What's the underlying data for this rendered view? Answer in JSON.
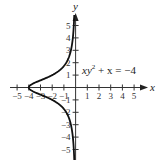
{
  "figure": {
    "x_axis_label": "x",
    "y_axis_label": "y",
    "equation": {
      "base": "xy",
      "superscript": "2",
      "rest": " + x = −4"
    },
    "x_ticks": [
      "−5",
      "−4",
      "−3",
      "−2",
      "−1",
      "1",
      "2",
      "3",
      "4",
      "5"
    ],
    "y_ticks": [
      "5",
      "4",
      "3",
      "2",
      "1",
      "−1",
      "−2",
      "−3",
      "−4",
      "−5"
    ]
  },
  "chart_data": {
    "type": "line",
    "title": "",
    "equation": "xy^2 + x = -4",
    "function": "x = -4 / (1 + y^2)",
    "xlabel": "x",
    "ylabel": "y",
    "xlim": [
      -5,
      5
    ],
    "ylim": [
      -5,
      5
    ],
    "x_tick_labels": [
      -5,
      -4,
      -3,
      -2,
      -1,
      1,
      2,
      3,
      4,
      5
    ],
    "y_tick_labels": [
      -5,
      -4,
      -3,
      -2,
      -1,
      1,
      2,
      3,
      4,
      5
    ],
    "series": [
      {
        "name": "xy^2 + x = -4",
        "points": [
          [
            -0.11,
            -5.9
          ],
          [
            -0.15,
            -5
          ],
          [
            -0.24,
            -4
          ],
          [
            -0.4,
            -3
          ],
          [
            -0.8,
            -2
          ],
          [
            -2,
            -1
          ],
          [
            -3.2,
            -0.5
          ],
          [
            -4,
            0
          ],
          [
            -3.2,
            0.5
          ],
          [
            -2,
            1
          ],
          [
            -0.8,
            2
          ],
          [
            -0.4,
            3
          ],
          [
            -0.24,
            4
          ],
          [
            -0.15,
            5
          ],
          [
            -0.11,
            5.9
          ]
        ]
      }
    ],
    "grid": false,
    "axes_arrows": true
  }
}
